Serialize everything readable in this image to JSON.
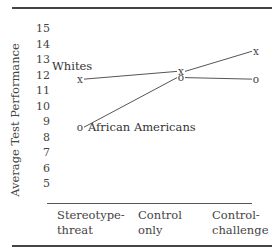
{
  "chart_data": {
    "type": "line",
    "title": "",
    "xlabel": "",
    "ylabel": "Average Test Performance",
    "ylim": [
      5,
      15
    ],
    "yticks": [
      15,
      14,
      13,
      12,
      11,
      10,
      9,
      8,
      7,
      6,
      5
    ],
    "categories": [
      "Stereotype-threat",
      "Control only",
      "Control-challenge"
    ],
    "category_lines": [
      [
        "Stereotype-",
        "threat"
      ],
      [
        "Control",
        "only"
      ],
      [
        "Control-",
        "challenge"
      ]
    ],
    "series": [
      {
        "name": "Whites",
        "marker": "x",
        "values": [
          11.7,
          12.2,
          13.5
        ]
      },
      {
        "name": "African Americans",
        "marker": "o",
        "values": [
          8.6,
          11.8,
          11.7
        ]
      }
    ],
    "grid": false,
    "legend": "inline labels"
  }
}
